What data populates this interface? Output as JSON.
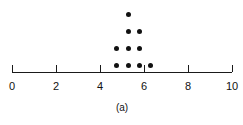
{
  "chart_data": {
    "type": "scatter",
    "plot_style": "dotplot",
    "title": "",
    "subtitle": "",
    "xlabel": "",
    "ylabel": "",
    "panel_label": "(a)",
    "grid": false,
    "legend": false,
    "xlim": [
      0,
      10
    ],
    "xticks": [
      0,
      2,
      4,
      6,
      8,
      10
    ],
    "xtick_labels": [
      "0",
      "2",
      "4",
      "6",
      "8",
      "10"
    ],
    "axis_color": "#1a1a1a",
    "dot_color": "#111111",
    "stacks": [
      {
        "x": 4.75,
        "count": 2
      },
      {
        "x": 5.3,
        "count": 4
      },
      {
        "x": 5.8,
        "count": 3
      },
      {
        "x": 6.3,
        "count": 1
      }
    ],
    "values": [
      4.75,
      4.75,
      5.3,
      5.3,
      5.3,
      5.3,
      5.8,
      5.8,
      5.8,
      6.3
    ],
    "n": 10,
    "points": [
      {
        "x": 4.75,
        "stack": 1
      },
      {
        "x": 4.75,
        "stack": 2
      },
      {
        "x": 5.3,
        "stack": 1
      },
      {
        "x": 5.3,
        "stack": 2
      },
      {
        "x": 5.3,
        "stack": 3
      },
      {
        "x": 5.3,
        "stack": 4
      },
      {
        "x": 5.8,
        "stack": 1
      },
      {
        "x": 5.8,
        "stack": 2
      },
      {
        "x": 5.8,
        "stack": 3
      },
      {
        "x": 6.3,
        "stack": 1
      }
    ]
  },
  "layout": {
    "axis_y": 72,
    "axis_x_start": 12,
    "axis_x_end": 232,
    "px_per_unit": 22,
    "tick_height": 7,
    "dot_size": 5,
    "row_pitch": 17,
    "first_row_y": 65,
    "label_y": 80,
    "panel_label_y": 102
  }
}
